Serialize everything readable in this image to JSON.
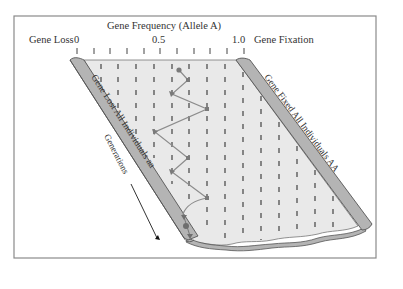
{
  "diagram": {
    "title": "Gene Frequency (Allele A)",
    "left_axis_label": "Gene Loss",
    "right_axis_label": "Gene Fixation",
    "axis_ticks": {
      "start_label": "0",
      "mid_label": "0.5",
      "end_label": "1.0",
      "count": 11
    },
    "left_band_label": "Gene Lost All Individuals aa",
    "right_band_label": "Gene Fixed All Individuals AA",
    "time_arrow_label": "Generations",
    "colors": {
      "frame": "#8a8a8a",
      "interior_fill": "#e9e9e9",
      "band_fill": "#b4b4b4",
      "band_stroke": "#555555",
      "path_stroke": "#8c8c8c",
      "path_marker": "#7a7a7a",
      "tick": "#444444",
      "text": "#333333"
    },
    "drift_path": {
      "description": "Random walk of allele A frequency across generations ending in gene loss",
      "points": [
        {
          "x": 179,
          "y": 70
        },
        {
          "x": 188,
          "y": 80
        },
        {
          "x": 172,
          "y": 94
        },
        {
          "x": 207,
          "y": 109
        },
        {
          "x": 155,
          "y": 132
        },
        {
          "x": 188,
          "y": 158
        },
        {
          "x": 172,
          "y": 172
        },
        {
          "x": 207,
          "y": 198
        }
      ],
      "end_state": "Gene Lost"
    }
  }
}
